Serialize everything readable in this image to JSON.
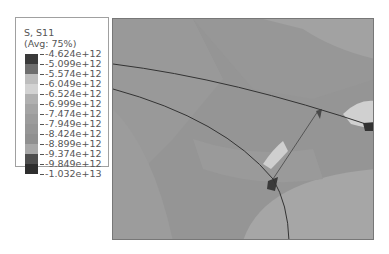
{
  "legend": {
    "title_line1": "S, S11",
    "title_line2": "(Avg: 75%)",
    "values": [
      "-4.624e+12",
      "-5.099e+12",
      "-5.574e+12",
      "-6.049e+12",
      "-6.524e+12",
      "-6.999e+12",
      "-7.474e+12",
      "-7.949e+12",
      "-8.424e+12",
      "-8.899e+12",
      "-9.374e+12",
      "-9.849e+12",
      "-1.032e+13"
    ],
    "colors": [
      "#3a3a3a",
      "#6e6e6e",
      "#bdbdbd",
      "#d2d2d2",
      "#b0b0b0",
      "#a4a4a4",
      "#9c9c9c",
      "#969696",
      "#909090",
      "#a8a8a8",
      "#4e4e4e",
      "#2e2e2e"
    ]
  },
  "plot": {
    "description": "Stress contour plot (S11) of a grain structure with boundaries",
    "background": "#959595"
  }
}
